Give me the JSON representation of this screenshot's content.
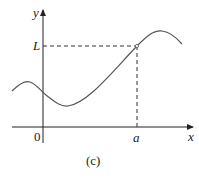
{
  "figure": {
    "caption": "(c)",
    "axes": {
      "x_label": "x",
      "y_label": "y",
      "origin_label": "0"
    },
    "marks": {
      "x_mark": "a",
      "y_mark": "L"
    },
    "colors": {
      "curve": "#555555",
      "axis": "#222222",
      "dashed": "#333333"
    }
  }
}
